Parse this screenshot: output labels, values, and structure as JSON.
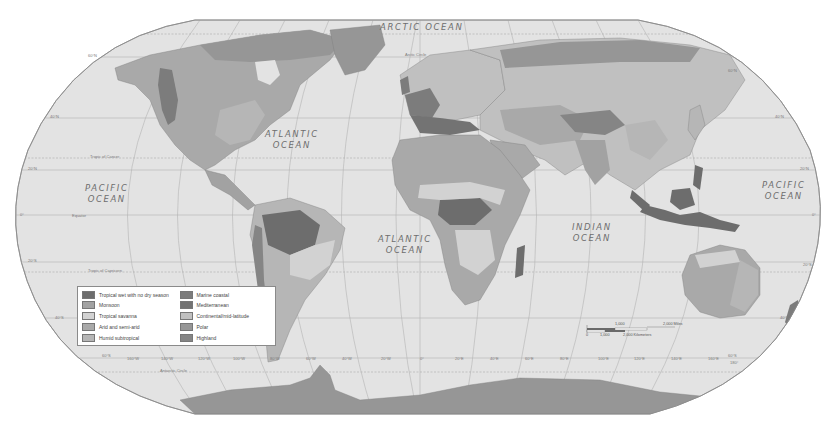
{
  "map": {
    "title": "World Climate Regions",
    "projection": "Robinson",
    "colors": {
      "ocean": "#e3e3e3",
      "land_default": "#b9b9b9",
      "graticule": "#b4b4b4",
      "border": "#808080"
    },
    "oceans": [
      {
        "id": "arctic",
        "label": "ARCTIC OCEAN"
      },
      {
        "id": "atlantic-north",
        "line1": "ATLANTIC",
        "line2": "OCEAN"
      },
      {
        "id": "atlantic-south",
        "line1": "ATLANTIC",
        "line2": "OCEAN"
      },
      {
        "id": "pacific-west",
        "line1": "PACIFIC",
        "line2": "OCEAN"
      },
      {
        "id": "pacific-east",
        "line1": "PACIFIC",
        "line2": "OCEAN"
      },
      {
        "id": "indian",
        "line1": "INDIAN",
        "line2": "OCEAN"
      }
    ],
    "lines": {
      "arctic_circle": "Arctic Circle",
      "tropic_of_cancer": "Tropic of Cancer",
      "equator": "Equator",
      "tropic_of_capricorn": "Tropic of Capricorn",
      "antarctic_circle": "Antarctic Circle"
    },
    "latitude_labels": {
      "n60": "60°N",
      "n40": "40°N",
      "n20": "20°N",
      "eq": "0°",
      "s20": "20°S",
      "s40": "40°S",
      "s60": "60°S"
    },
    "longitude_labels": [
      "160°W",
      "140°W",
      "120°W",
      "100°W",
      "80°W",
      "60°W",
      "40°W",
      "20°W",
      "0°",
      "20°E",
      "40°E",
      "60°E",
      "80°E",
      "100°E",
      "120°E",
      "140°E",
      "160°E",
      "180°"
    ]
  },
  "legend": {
    "items": [
      {
        "label": "Tropical wet with no dry season",
        "color": "#6d6d6d"
      },
      {
        "label": "Monsoon",
        "color": "#a2a2a2"
      },
      {
        "label": "Tropical savanna",
        "color": "#d2d2d2"
      },
      {
        "label": "Arid and semi-arid",
        "color": "#a9a9a9"
      },
      {
        "label": "Humid subtropical",
        "color": "#b6b6b6"
      },
      {
        "label": "Marine coastal",
        "color": "#7c7c7c"
      },
      {
        "label": "Mediterranean",
        "color": "#737373"
      },
      {
        "label": "Continental/mid-latitude",
        "color": "#c0c0c0"
      },
      {
        "label": "Polar",
        "color": "#969696"
      },
      {
        "label": "Highland",
        "color": "#858585"
      }
    ]
  },
  "scale_bar": {
    "miles_mid": "1,000",
    "miles_end": "2,000 Miles",
    "km_zero": "0",
    "km_mid": "1,000",
    "km_end": "2,000 Kilometers"
  }
}
